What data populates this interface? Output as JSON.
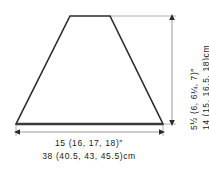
{
  "diagram": {
    "title_semantic": "garment-schematic-trapezoid",
    "shape": {
      "name": "trapezoid",
      "outline_color": "#2b2b2b",
      "fill_color": "#ffffff",
      "points": "70,16 110,16 163,124 16,124"
    },
    "background_color": "#ffffff",
    "dimension_line_color": "#9a9a9a",
    "text_color": "#1a1a1a"
  },
  "measurements": {
    "width": {
      "imperial": "15 (16, 17, 18)″",
      "metric": "38 (40.5, 43, 45.5)cm"
    },
    "height": {
      "imperial": "5½ (6, 6¼, 7)″",
      "metric": "14 (15, 16.5, 18)cm"
    }
  }
}
